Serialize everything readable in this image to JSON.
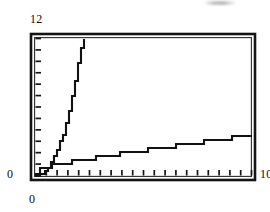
{
  "figure": {
    "title": "",
    "background_color": "#ffffff",
    "ink_color": "#121212"
  },
  "labels": {
    "y_max": "12",
    "y_zero": "0",
    "x_zero": "0",
    "x_max": "10"
  },
  "artifacts": {
    "top_smudge_name": "scan-smudge"
  },
  "chart_data": {
    "type": "line",
    "title": "",
    "subtitle": "",
    "xlabel": "",
    "ylabel": "",
    "xlim": [
      0,
      10
    ],
    "ylim": [
      0,
      12
    ],
    "grid": false,
    "legend": "none",
    "x_tick_labels": [
      "0",
      "10"
    ],
    "y_tick_labels": [
      "0",
      "12"
    ],
    "x_minor_tick_count": 20,
    "y_minor_tick_count": 12,
    "frame": "full-box",
    "render_style": "stair-stepped-scan",
    "series": [
      {
        "name": "steep-growth-curve",
        "description": "fast rising curve reaching top of plot near x = 2.3",
        "x": [
          0,
          0.2,
          0.4,
          0.6,
          0.8,
          1.0,
          1.2,
          1.4,
          1.6,
          1.8,
          2.0,
          2.2,
          2.3
        ],
        "values": [
          0,
          0.1,
          0.3,
          0.7,
          1.2,
          1.9,
          2.9,
          4.1,
          5.6,
          7.4,
          9.4,
          11.4,
          12.0
        ]
      },
      {
        "name": "slow-growth-curve",
        "description": "slowly rising concave curve reaching about 3.5 at x = 10",
        "x": [
          0,
          0.25,
          0.5,
          1.0,
          1.5,
          2.0,
          2.5,
          3.0,
          3.5,
          4.0,
          4.5,
          5.0,
          5.5,
          6.0,
          6.5,
          7.0,
          7.5,
          8.0,
          8.5,
          9.0,
          9.5,
          10.0
        ],
        "values": [
          0,
          0.5,
          0.7,
          0.95,
          1.15,
          1.3,
          1.45,
          1.6,
          1.75,
          1.9,
          2.05,
          2.2,
          2.35,
          2.5,
          2.62,
          2.75,
          2.88,
          3.0,
          3.12,
          3.25,
          3.38,
          3.5
        ]
      }
    ]
  }
}
